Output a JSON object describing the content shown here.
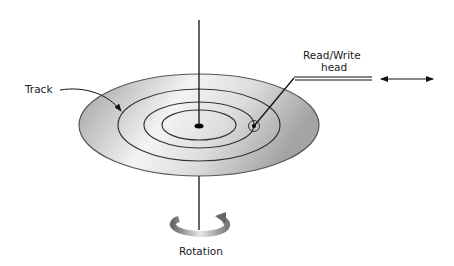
{
  "diagram": {
    "type": "disk-storage-schematic",
    "labels": {
      "track": "Track",
      "head_line1": "Read/Write",
      "head_line2": "head",
      "rotation": "Rotation"
    },
    "components": {
      "platter": {
        "shape": "ellipse",
        "fill_gradient": [
          "#9a9a9a",
          "#f2f2f2",
          "#a8a8a8"
        ],
        "stroke": "#555555"
      },
      "tracks": {
        "count": 3,
        "stroke": "#333333"
      },
      "spindle": {
        "stroke": "#111111"
      },
      "head_arm": {
        "style": "double-line",
        "stroke": "#222222"
      },
      "motion_arrow": {
        "direction": "bidirectional-horizontal"
      },
      "rotation_arrow": {
        "direction": "circular"
      }
    },
    "colors": {
      "background": "#ffffff",
      "line": "#1a1a1a",
      "disk_dark": "#9a9a9a",
      "disk_light": "#f0f0f0"
    }
  }
}
